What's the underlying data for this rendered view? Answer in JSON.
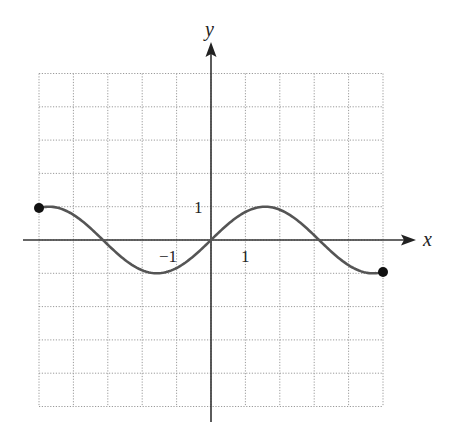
{
  "chart_data": {
    "type": "line",
    "title": "",
    "xlabel": "x",
    "ylabel": "y",
    "xlim": [
      -5,
      5
    ],
    "ylim": [
      -5,
      5
    ],
    "grid": true,
    "grid_style": "dotted",
    "legend": null,
    "tick_labels": {
      "x": [
        {
          "value": -1,
          "label": "−1"
        },
        {
          "value": 1,
          "label": "1"
        }
      ],
      "y": [
        {
          "value": 1,
          "label": "1"
        }
      ]
    },
    "series": [
      {
        "name": "y = sin x",
        "function": "sin(x)",
        "domain": [
          -5,
          5
        ],
        "color": "#555555",
        "x": [
          -5,
          -4.5,
          -4,
          -3.5,
          -3.14,
          -3,
          -2.5,
          -2,
          -1.57,
          -1,
          -0.5,
          0,
          0.5,
          1,
          1.57,
          2,
          2.5,
          3,
          3.14,
          3.5,
          4,
          4.5,
          5
        ],
        "y": [
          0.96,
          0.98,
          0.76,
          0.35,
          0,
          -0.14,
          -0.6,
          -0.91,
          -1,
          -0.84,
          -0.48,
          0,
          0.48,
          0.84,
          1,
          0.91,
          0.6,
          0.14,
          0,
          -0.35,
          -0.76,
          -0.98,
          -0.96
        ]
      }
    ],
    "endpoints": [
      {
        "x": -5,
        "y": 0.96,
        "style": "closed"
      },
      {
        "x": 5,
        "y": -0.96,
        "style": "closed"
      }
    ]
  },
  "labels": {
    "x_axis": "x",
    "y_axis": "y",
    "tick_x_neg1": "−1",
    "tick_x_1": "1",
    "tick_y_1": "1"
  }
}
